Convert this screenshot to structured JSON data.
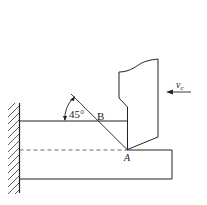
{
  "diagram": {
    "type": "orthogonal-cutting-shear-plane",
    "angle_label": "45°",
    "point_b_label": "B",
    "point_a_label": "A",
    "velocity_label_main": "v",
    "velocity_label_sub": "c",
    "colors": {
      "line": "#222222",
      "background": "#ffffff"
    }
  }
}
